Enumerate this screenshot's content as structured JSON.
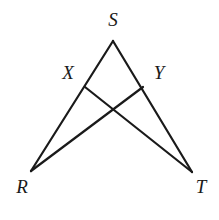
{
  "figure": {
    "background_color": "#ffffff",
    "stroke_color": "#1a1a1a",
    "stroke_width": 2.2,
    "canvas": {
      "width": 219,
      "height": 220
    }
  },
  "points": {
    "S": {
      "label": "S",
      "x": 113,
      "y": 41,
      "label_x": 113,
      "label_y": 22
    },
    "X": {
      "label": "X",
      "x": 85,
      "y": 87,
      "label_x": 68,
      "label_y": 75
    },
    "Y": {
      "label": "Y",
      "x": 143,
      "y": 87,
      "label_x": 159,
      "label_y": 75
    },
    "R": {
      "label": "R",
      "x": 31,
      "y": 171,
      "label_x": 22,
      "label_y": 189
    },
    "T": {
      "label": "T",
      "x": 192,
      "y": 172,
      "label_x": 201,
      "label_y": 189
    },
    "P": {
      "label": "",
      "x": 113,
      "y": 105
    }
  },
  "segments": [
    {
      "name": "segment-S-R",
      "from": "S",
      "to": "R"
    },
    {
      "name": "segment-S-T",
      "from": "S",
      "to": "T"
    },
    {
      "name": "segment-X-T",
      "from": "X",
      "to": "T"
    },
    {
      "name": "segment-Y-R",
      "from": "Y",
      "to": "R"
    }
  ],
  "labels": {
    "S": "S",
    "X": "X",
    "Y": "Y",
    "R": "R",
    "T": "T"
  }
}
